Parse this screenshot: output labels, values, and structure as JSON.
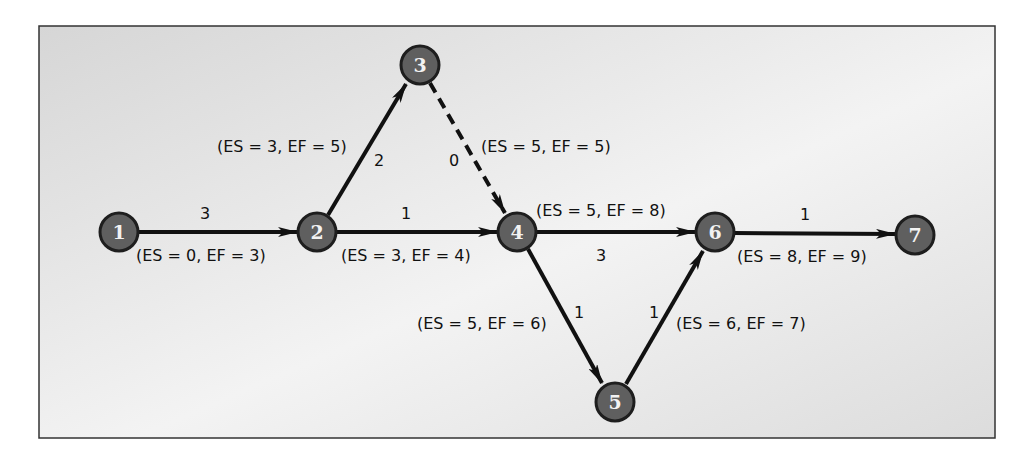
{
  "diagram": {
    "type": "activity-on-arrow network",
    "colors": {
      "node_fill": "#5f5f5f",
      "node_stroke": "#1e1e1e",
      "edge": "#111111",
      "panel_from": "#d9d9d9",
      "panel_to": "#f4f4f4",
      "border": "#333333"
    },
    "nodes": [
      {
        "id": "1",
        "label": "1",
        "x": 119,
        "y": 232
      },
      {
        "id": "2",
        "label": "2",
        "x": 317,
        "y": 232
      },
      {
        "id": "3",
        "label": "3",
        "x": 420,
        "y": 65
      },
      {
        "id": "4",
        "label": "4",
        "x": 517,
        "y": 232
      },
      {
        "id": "5",
        "label": "5",
        "x": 615,
        "y": 402
      },
      {
        "id": "6",
        "label": "6",
        "x": 715,
        "y": 232
      },
      {
        "id": "7",
        "label": "7",
        "x": 915,
        "y": 235
      }
    ],
    "edges": [
      {
        "from": "1",
        "to": "2",
        "duration": "3",
        "es_ef": "(ES = 0, EF = 3)",
        "dashed": false
      },
      {
        "from": "2",
        "to": "3",
        "duration": "2",
        "es_ef": "(ES = 3, EF = 5)",
        "dashed": false
      },
      {
        "from": "2",
        "to": "4",
        "duration": "1",
        "es_ef": "(ES = 3, EF = 4)",
        "dashed": false
      },
      {
        "from": "3",
        "to": "4",
        "duration": "0",
        "es_ef": "(ES = 5, EF = 5)",
        "dashed": true
      },
      {
        "from": "4",
        "to": "6",
        "duration": "3",
        "es_ef": "(ES = 5, EF = 8)",
        "dashed": false
      },
      {
        "from": "4",
        "to": "5",
        "duration": "1",
        "es_ef": "(ES = 5, EF = 6)",
        "dashed": false
      },
      {
        "from": "5",
        "to": "6",
        "duration": "1",
        "es_ef": "(ES = 6, EF = 7)",
        "dashed": false
      },
      {
        "from": "6",
        "to": "7",
        "duration": "1",
        "es_ef": "(ES = 8, EF = 9)",
        "dashed": false
      }
    ]
  }
}
